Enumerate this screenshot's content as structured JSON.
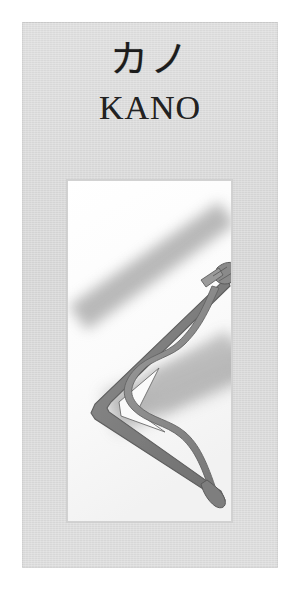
{
  "document": {
    "type": "trademark-logo-specimen",
    "background_color": "#ffffff"
  },
  "specimen": {
    "panel_color": "#d9d9d9",
    "wordmark": {
      "kana": "カノ",
      "kana_reading": "ka-no",
      "romaji": "KANO",
      "text_color": "#1c1c1c"
    },
    "artwork": {
      "panel_color": "#fbfbfb",
      "caption": "Stylized Japanese bow (yumi) with drawn bowstring over two diagonal brush strokes",
      "ink_color": "#808080",
      "ink_outline_color": "#5e5e5e",
      "brushstroke_color": "#9a9a9a",
      "elements": [
        "upper-brushstroke",
        "lower-brushstroke",
        "bow-limb-chevron",
        "bowstring",
        "nock-grip-top",
        "nock-tip-bottom"
      ]
    }
  }
}
